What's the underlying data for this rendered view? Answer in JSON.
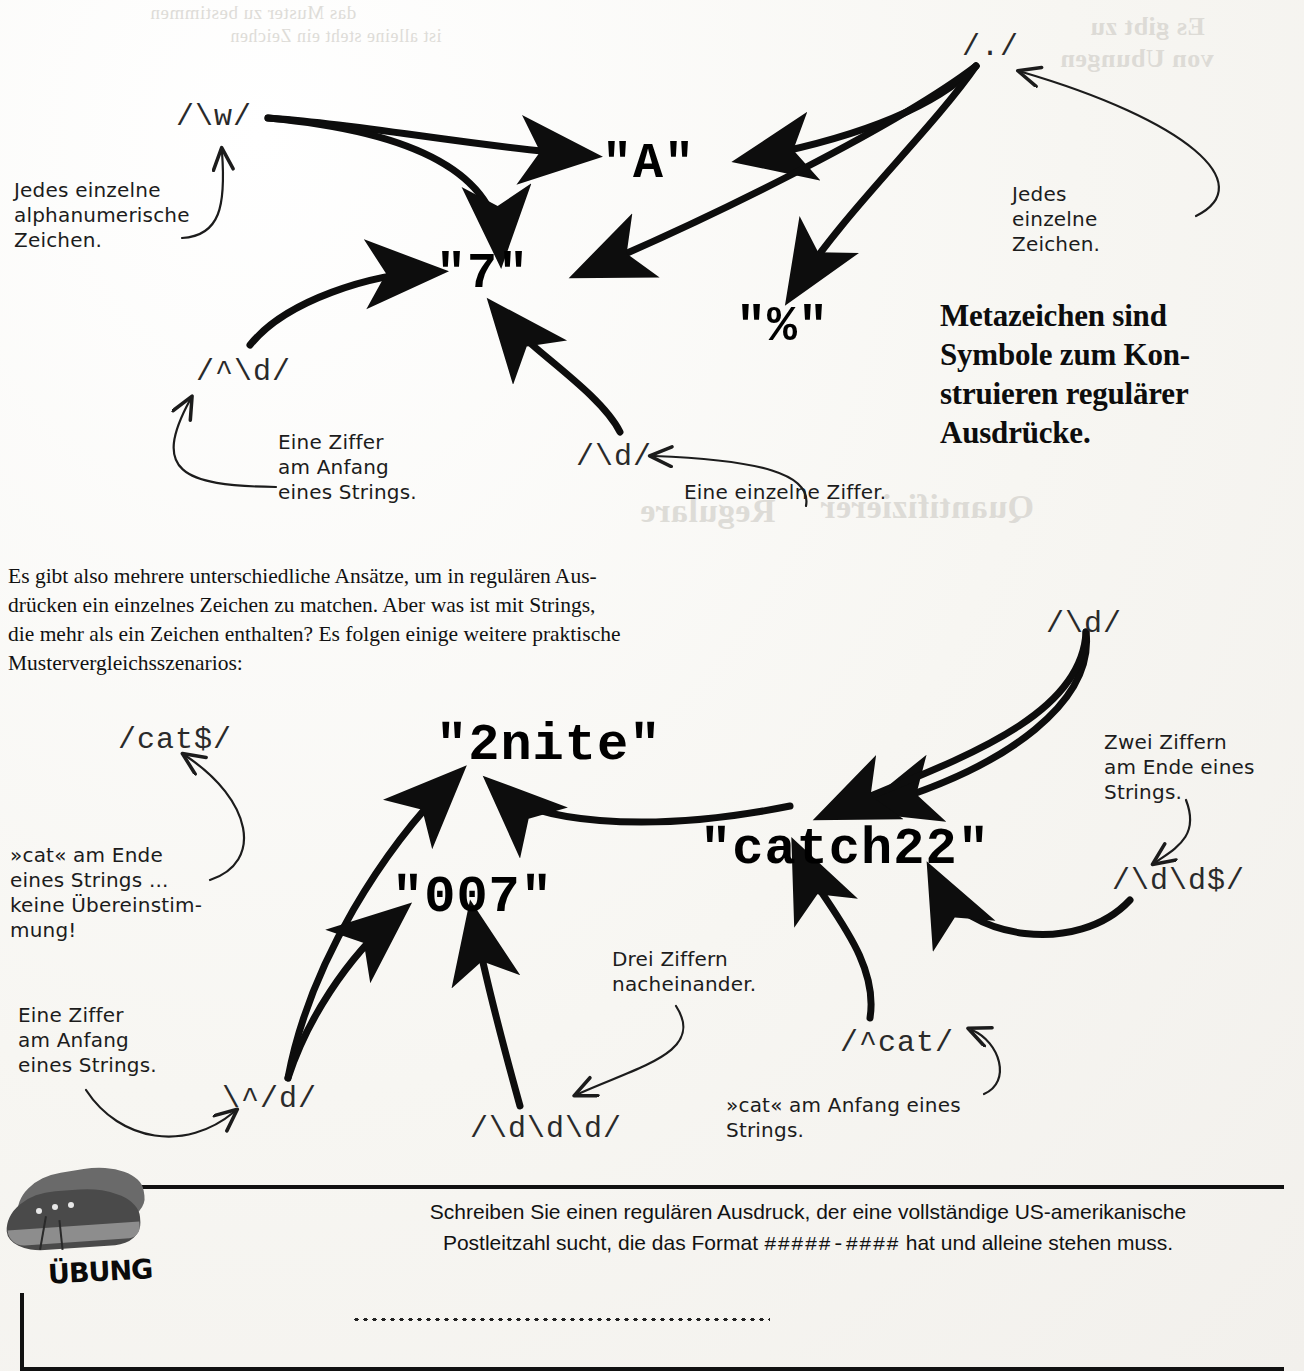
{
  "page": {
    "width": 1304,
    "height": 1371,
    "paper_color": "#faf9f6",
    "ink_color": "#111111"
  },
  "ghost_bleed": [
    {
      "text": "das Muster zu bestimmen",
      "x": 150,
      "y": 2
    },
    {
      "text": "ist alleine steht ein Zeichen",
      "x": 230,
      "y": 26
    },
    {
      "text": "Es gibt zu",
      "x": 1090,
      "y": 12
    },
    {
      "text": "von Ubungen",
      "x": 1070,
      "y": 44
    },
    {
      "text": "Quantifizierer",
      "x": 820,
      "y": 490
    },
    {
      "text": "Regulare",
      "x": 640,
      "y": 494
    }
  ],
  "regex_labels": [
    {
      "id": "w",
      "text": "/\\w/",
      "x": 176,
      "y": 100,
      "size": 31
    },
    {
      "id": "dot",
      "text": "/./",
      "x": 962,
      "y": 30,
      "size": 31
    },
    {
      "id": "caret_d",
      "text": "/^\\d/",
      "x": 196,
      "y": 355,
      "size": 31
    },
    {
      "id": "d_single",
      "text": "/\\d/",
      "x": 576,
      "y": 440,
      "size": 31
    },
    {
      "id": "d_right",
      "text": "/\\d/",
      "x": 1046,
      "y": 607,
      "size": 31
    },
    {
      "id": "cat_end",
      "text": "/cat$/",
      "x": 118,
      "y": 723,
      "size": 31
    },
    {
      "id": "dd_end",
      "text": "/\\d\\d$/",
      "x": 1112,
      "y": 864,
      "size": 31
    },
    {
      "id": "cat_start",
      "text": "/^cat/",
      "x": 840,
      "y": 1026,
      "size": 31
    },
    {
      "id": "caret_d2",
      "text": "\\^/d/",
      "x": 222,
      "y": 1082,
      "size": 31
    },
    {
      "id": "ddd",
      "text": "/\\d\\d\\d/",
      "x": 470,
      "y": 1112,
      "size": 31
    }
  ],
  "sample_strings": [
    {
      "id": "A",
      "text": "\"A\"",
      "x": 602,
      "y": 135,
      "size": 50
    },
    {
      "id": "seven",
      "text": "\"7\"",
      "x": 436,
      "y": 245,
      "size": 50
    },
    {
      "id": "percent",
      "text": "\"%\"",
      "x": 736,
      "y": 298,
      "size": 50
    },
    {
      "id": "2nite",
      "text": "\"2nite\"",
      "x": 436,
      "y": 716,
      "size": 52
    },
    {
      "id": "catch22",
      "text": "\"catch22\"",
      "x": 700,
      "y": 820,
      "size": 52
    },
    {
      "id": "007",
      "text": "\"007\"",
      "x": 392,
      "y": 868,
      "size": 52
    }
  ],
  "handwritten_notes": [
    {
      "id": "note-w",
      "text": "Jedes einzelne\nalphanumerische\nZeichen.",
      "x": 14,
      "y": 178
    },
    {
      "id": "note-dot",
      "text": "Jedes\neinzelne\nZeichen.",
      "x": 1012,
      "y": 182
    },
    {
      "id": "note-caret-d",
      "text": "Eine Ziffer\nam Anfang\neines Strings.",
      "x": 278,
      "y": 430
    },
    {
      "id": "note-d-single",
      "text": "Eine einzelne Ziffer.",
      "x": 684,
      "y": 480
    },
    {
      "id": "note-cat-end",
      "text": "»cat« am Ende\neines Strings ...\nkeine Übereinstim-\nmung!",
      "x": 10,
      "y": 843
    },
    {
      "id": "note-dd-end",
      "text": "Zwei Ziffern\nam Ende eines\nStrings.",
      "x": 1104,
      "y": 730
    },
    {
      "id": "note-digit-start",
      "text": "Eine Ziffer\nam Anfang\neines Strings.",
      "x": 18,
      "y": 1003
    },
    {
      "id": "note-ddd",
      "text": "Drei Ziffern\nnacheinander.",
      "x": 612,
      "y": 947
    },
    {
      "id": "note-cat-start",
      "text": "»cat« am Anfang eines\nStrings.",
      "x": 726,
      "y": 1093
    }
  ],
  "callout": {
    "text": "Metazeichen sind\nSymbole zum Kon-\nstruieren regulärer\nAusdrücke.",
    "x": 940,
    "y": 296
  },
  "body_paragraph": {
    "text": "Es gibt also mehrere unterschiedliche Ansätze, um in regulären Aus-\ndrücken ein einzelnes Zeichen zu matchen. Aber was ist mit Strings,\ndie mehr als ein Zeichen enthalten? Es folgen einige weitere praktische\nMustervergleichsszenarios:",
    "x": 8,
    "y": 562
  },
  "exercise": {
    "label": "ÜBUNG",
    "icon": "running-shoes-image",
    "text_before": "Schreiben Sie einen regulären Ausdruck, der eine vollständige US-amerikanische\nPostleitzahl sucht, die das Format ",
    "format": "#####-####",
    "text_after": " hat und alleine stehen muss.",
    "answer_line": "dotted-answer-line"
  }
}
